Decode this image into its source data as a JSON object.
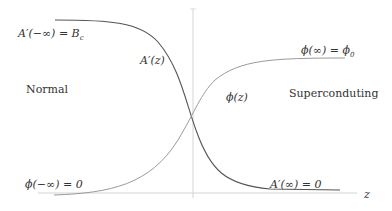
{
  "diagram": {
    "type": "function-profile",
    "axes": {
      "x_label": "z",
      "horizontal_axis_color": "#cfcfcf",
      "vertical_axis_color": "#cfcfcf"
    },
    "curves": [
      {
        "name": "A'(z)",
        "label": "A′(z)",
        "shape": "decreasing-sigmoid",
        "color": "#555555"
      },
      {
        "name": "phi(z)",
        "label": "ϕ(z)",
        "shape": "increasing-sigmoid",
        "color": "#9a9a9a"
      }
    ],
    "boundary_labels": {
      "a_minus_inf_lhs": "A′(−∞) = B",
      "a_minus_inf_sub": "c",
      "a_plus_inf": "A′(∞) = 0",
      "phi_minus_inf": "ϕ(−∞) = 0",
      "phi_plus_inf_lhs": "ϕ(∞) = ϕ",
      "phi_plus_inf_sub": "0"
    },
    "region_labels": {
      "left": "Normal",
      "right": "Superconduting"
    }
  }
}
